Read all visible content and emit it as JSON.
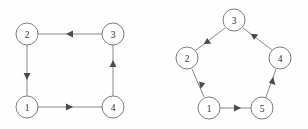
{
  "figure": {
    "background_color": "#fefefe",
    "node_fill_color": "#ffffff",
    "node_stroke_color": "#6e6e6e",
    "edge_color": "#7a7a7a",
    "arrow_color": "#4a4a4a",
    "label_color": "#2e2e2e",
    "node_radius": 11
  },
  "graphs": [
    {
      "id": "square-graph",
      "name": "4-cycle square graph",
      "shape": "square",
      "node_count": 4,
      "nodes": [
        {
          "id": "sq-n1",
          "label": "1",
          "cx": 27,
          "cy": 107
        },
        {
          "id": "sq-n2",
          "label": "2",
          "cx": 27,
          "cy": 34
        },
        {
          "id": "sq-n3",
          "label": "3",
          "cx": 113,
          "cy": 34
        },
        {
          "id": "sq-n4",
          "label": "4",
          "cx": 113,
          "cy": 107
        }
      ],
      "edges": [
        {
          "id": "sq-e1",
          "from": "1",
          "to": "4",
          "direction": "right",
          "x1": 38,
          "y1": 107,
          "x2": 102,
          "y2": 107
        },
        {
          "id": "sq-e2",
          "from": "4",
          "to": "3",
          "direction": "up",
          "x1": 113,
          "y1": 96,
          "x2": 113,
          "y2": 45
        },
        {
          "id": "sq-e3",
          "from": "3",
          "to": "2",
          "direction": "left",
          "x1": 102,
          "y1": 34,
          "x2": 38,
          "y2": 34
        },
        {
          "id": "sq-e4",
          "from": "2",
          "to": "1",
          "direction": "down",
          "x1": 27,
          "y1": 45,
          "x2": 27,
          "y2": 96
        }
      ],
      "cycle_order": [
        "1",
        "4",
        "3",
        "2"
      ]
    },
    {
      "id": "pentagon-graph",
      "name": "5-cycle pentagon graph",
      "shape": "pentagon",
      "node_count": 5,
      "nodes": [
        {
          "id": "pg-n1",
          "label": "1",
          "cx": 209,
          "cy": 108
        },
        {
          "id": "pg-n2",
          "label": "2",
          "cx": 187,
          "cy": 58
        },
        {
          "id": "pg-n3",
          "label": "3",
          "cx": 234,
          "cy": 20
        },
        {
          "id": "pg-n4",
          "label": "4",
          "cx": 280,
          "cy": 58
        },
        {
          "id": "pg-n5",
          "label": "5",
          "cx": 262,
          "cy": 108
        }
      ],
      "edges": [
        {
          "id": "pg-e1",
          "from": "1",
          "to": "5",
          "direction": "right",
          "x1": 220,
          "y1": 108,
          "x2": 251,
          "y2": 108
        },
        {
          "id": "pg-e2",
          "from": "5",
          "to": "4",
          "direction": "up-right",
          "x1": 266,
          "y1": 97,
          "x2": 276,
          "y2": 69
        },
        {
          "id": "pg-e3",
          "from": "4",
          "to": "3",
          "direction": "up-left",
          "x1": 272,
          "y1": 50,
          "x2": 243,
          "y2": 28
        },
        {
          "id": "pg-e4",
          "from": "3",
          "to": "2",
          "direction": "down-left",
          "x1": 225,
          "y1": 28,
          "x2": 196,
          "y2": 50
        },
        {
          "id": "pg-e5",
          "from": "2",
          "to": "1",
          "direction": "down-right",
          "x1": 192,
          "y1": 69,
          "x2": 204,
          "y2": 97
        }
      ],
      "cycle_order": [
        "1",
        "5",
        "4",
        "3",
        "2"
      ]
    }
  ]
}
